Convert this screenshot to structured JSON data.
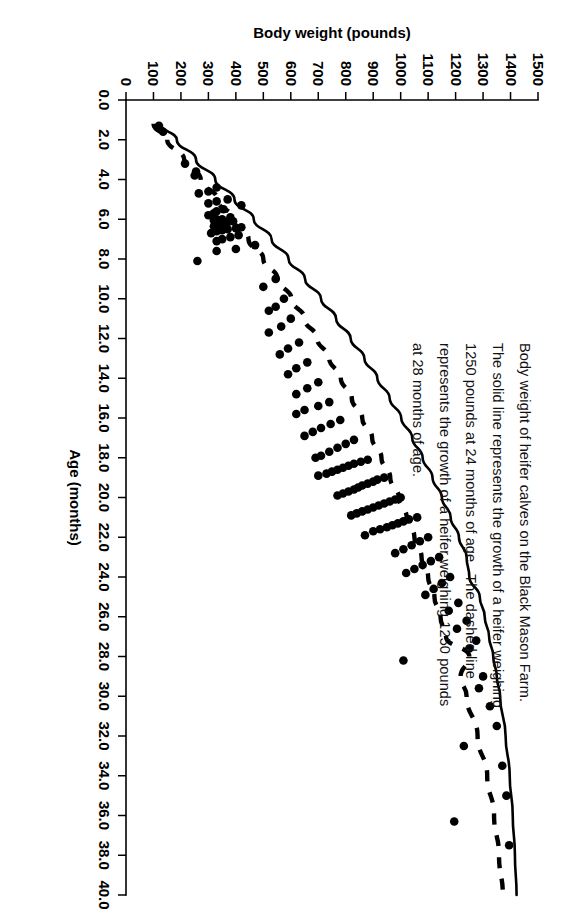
{
  "figure": {
    "caption": "Body weight of heifer calves on the Black Mason Farm.  The solid line represents the growth of a heifer weighing 1250 pounds at 24 months of age.  The dashed line represents the growth of a heifer weighing 1250 pounds at 28 months of age.",
    "ink_color": "#000000",
    "background_color": "#ffffff"
  },
  "chart_data": {
    "type": "scatter",
    "title": "",
    "subtitle": "",
    "xlabel": "Age (months)",
    "ylabel": "Body weight (pounds)",
    "xlim": [
      0,
      40
    ],
    "ylim": [
      0,
      1500
    ],
    "xticks": [
      "0.0",
      "2.0",
      "4.0",
      "6.0",
      "8.0",
      "10.0",
      "12.0",
      "14.0",
      "16.0",
      "18.0",
      "20.0",
      "22.0",
      "24.0",
      "26.0",
      "28.0",
      "30.0",
      "32.0",
      "34.0",
      "36.0",
      "38.0",
      "40.0"
    ],
    "xtick_values": [
      0,
      2,
      4,
      6,
      8,
      10,
      12,
      14,
      16,
      18,
      20,
      22,
      24,
      26,
      28,
      30,
      32,
      34,
      36,
      38,
      40
    ],
    "yticks": [
      "0",
      "100",
      "200",
      "300",
      "400",
      "500",
      "600",
      "700",
      "800",
      "900",
      "1000",
      "1100",
      "1200",
      "1300",
      "1400",
      "1500"
    ],
    "ytick_values": [
      0,
      100,
      200,
      300,
      400,
      500,
      600,
      700,
      800,
      900,
      1000,
      1100,
      1200,
      1300,
      1400,
      1500
    ],
    "grid": false,
    "legend_position": "none",
    "orientation": "rotated-90cw",
    "annotations": [
      "Body weight of heifer calves on the Black Mason Farm.",
      "The solid line represents the growth of a heifer weighing 1250 pounds at 24 months of age.",
      "The dashed line represents the growth of a heifer weighing 1250 pounds at 28 months of age."
    ],
    "series": [
      {
        "name": "Heifer calves (observed body weights)",
        "type": "scatter",
        "marker": "filled-circle",
        "color": "#000000",
        "points": [
          [
            1.3,
            120
          ],
          [
            1.6,
            135
          ],
          [
            3.2,
            215
          ],
          [
            3.6,
            255
          ],
          [
            3.8,
            250
          ],
          [
            4.4,
            330
          ],
          [
            4.6,
            300
          ],
          [
            4.7,
            265
          ],
          [
            5.0,
            370
          ],
          [
            5.1,
            330
          ],
          [
            5.2,
            300
          ],
          [
            5.3,
            420
          ],
          [
            5.5,
            355
          ],
          [
            5.6,
            330
          ],
          [
            5.7,
            320
          ],
          [
            5.8,
            300
          ],
          [
            5.9,
            380
          ],
          [
            6.0,
            350
          ],
          [
            6.0,
            330
          ],
          [
            6.05,
            320
          ],
          [
            6.1,
            390
          ],
          [
            6.15,
            370
          ],
          [
            6.2,
            355
          ],
          [
            6.25,
            340
          ],
          [
            6.3,
            330
          ],
          [
            6.35,
            320
          ],
          [
            6.4,
            420
          ],
          [
            6.45,
            400
          ],
          [
            6.5,
            370
          ],
          [
            6.55,
            350
          ],
          [
            6.6,
            330
          ],
          [
            6.7,
            310
          ],
          [
            6.8,
            410
          ],
          [
            6.9,
            380
          ],
          [
            7.0,
            350
          ],
          [
            7.1,
            330
          ],
          [
            7.3,
            470
          ],
          [
            7.5,
            400
          ],
          [
            7.6,
            330
          ],
          [
            8.1,
            260
          ],
          [
            9.0,
            545
          ],
          [
            9.4,
            500
          ],
          [
            10.0,
            575
          ],
          [
            10.4,
            545
          ],
          [
            10.6,
            520
          ],
          [
            11.0,
            600
          ],
          [
            11.4,
            565
          ],
          [
            11.7,
            520
          ],
          [
            12.2,
            630
          ],
          [
            12.5,
            590
          ],
          [
            12.8,
            560
          ],
          [
            13.2,
            660
          ],
          [
            13.5,
            620
          ],
          [
            13.8,
            590
          ],
          [
            14.2,
            700
          ],
          [
            14.5,
            660
          ],
          [
            14.8,
            620
          ],
          [
            15.2,
            740
          ],
          [
            15.4,
            700
          ],
          [
            15.6,
            650
          ],
          [
            15.8,
            620
          ],
          [
            16.1,
            780
          ],
          [
            16.3,
            745
          ],
          [
            16.5,
            710
          ],
          [
            16.7,
            680
          ],
          [
            16.9,
            650
          ],
          [
            17.1,
            830
          ],
          [
            17.3,
            800
          ],
          [
            17.5,
            770
          ],
          [
            17.7,
            740
          ],
          [
            17.9,
            710
          ],
          [
            18.0,
            690
          ],
          [
            18.1,
            880
          ],
          [
            18.2,
            855
          ],
          [
            18.3,
            830
          ],
          [
            18.4,
            810
          ],
          [
            18.5,
            790
          ],
          [
            18.6,
            770
          ],
          [
            18.7,
            750
          ],
          [
            18.8,
            730
          ],
          [
            18.9,
            700
          ],
          [
            19.0,
            940
          ],
          [
            19.1,
            915
          ],
          [
            19.2,
            900
          ],
          [
            19.3,
            880
          ],
          [
            19.4,
            860
          ],
          [
            19.5,
            845
          ],
          [
            19.6,
            830
          ],
          [
            19.7,
            810
          ],
          [
            19.8,
            790
          ],
          [
            19.9,
            770
          ],
          [
            20.0,
            1000
          ],
          [
            20.1,
            980
          ],
          [
            20.2,
            960
          ],
          [
            20.3,
            940
          ],
          [
            20.4,
            920
          ],
          [
            20.5,
            900
          ],
          [
            20.6,
            880
          ],
          [
            20.7,
            860
          ],
          [
            20.8,
            840
          ],
          [
            20.9,
            820
          ],
          [
            21.0,
            1060
          ],
          [
            21.1,
            1030
          ],
          [
            21.2,
            1010
          ],
          [
            21.3,
            990
          ],
          [
            21.4,
            970
          ],
          [
            21.5,
            950
          ],
          [
            21.6,
            925
          ],
          [
            21.7,
            900
          ],
          [
            21.9,
            870
          ],
          [
            22.0,
            1100
          ],
          [
            22.2,
            1070
          ],
          [
            22.4,
            1040
          ],
          [
            22.6,
            1010
          ],
          [
            22.8,
            980
          ],
          [
            23.0,
            1140
          ],
          [
            23.2,
            1110
          ],
          [
            23.4,
            1080
          ],
          [
            23.6,
            1050
          ],
          [
            23.8,
            1020
          ],
          [
            24.0,
            1180
          ],
          [
            24.3,
            1150
          ],
          [
            24.6,
            1120
          ],
          [
            24.9,
            1090
          ],
          [
            25.3,
            1210
          ],
          [
            25.7,
            1175
          ],
          [
            26.2,
            1240
          ],
          [
            26.6,
            1205
          ],
          [
            27.2,
            1275
          ],
          [
            27.6,
            1250
          ],
          [
            28.2,
            1010
          ],
          [
            29.0,
            1300
          ],
          [
            29.6,
            1285
          ],
          [
            30.5,
            1325
          ],
          [
            31.5,
            1350
          ],
          [
            32.5,
            1230
          ],
          [
            33.5,
            1370
          ],
          [
            35.0,
            1385
          ],
          [
            36.3,
            1195
          ],
          [
            37.5,
            1395
          ]
        ]
      },
      {
        "name": "Solid line — heifer weighing 1250 pounds at 24 months of age",
        "type": "line",
        "style": "solid",
        "color": "#000000",
        "points": [
          [
            1.2,
            125
          ],
          [
            2.0,
            185
          ],
          [
            3.0,
            255
          ],
          [
            4.0,
            325
          ],
          [
            5.0,
            395
          ],
          [
            6.0,
            465
          ],
          [
            7.0,
            530
          ],
          [
            8.0,
            592
          ],
          [
            9.0,
            652
          ],
          [
            10.0,
            710
          ],
          [
            11.0,
            765
          ],
          [
            12.0,
            818
          ],
          [
            13.0,
            868
          ],
          [
            14.0,
            915
          ],
          [
            15.0,
            960
          ],
          [
            16.0,
            1002
          ],
          [
            17.0,
            1042
          ],
          [
            18.0,
            1080
          ],
          [
            19.0,
            1116
          ],
          [
            20.0,
            1150
          ],
          [
            21.0,
            1182
          ],
          [
            22.0,
            1212
          ],
          [
            23.0,
            1240
          ],
          [
            24.0,
            1250
          ],
          [
            25.0,
            1288
          ],
          [
            26.0,
            1306
          ],
          [
            27.0,
            1322
          ],
          [
            28.0,
            1337
          ],
          [
            29.0,
            1350
          ],
          [
            30.0,
            1362
          ],
          [
            32.0,
            1382
          ],
          [
            34.0,
            1397
          ],
          [
            36.0,
            1408
          ],
          [
            38.0,
            1416
          ],
          [
            40.0,
            1422
          ]
        ]
      },
      {
        "name": "Dashed line — heifer weighing 1250 pounds at 28 months of age",
        "type": "line",
        "style": "dashed",
        "color": "#000000",
        "points": [
          [
            1.2,
            100
          ],
          [
            2.0,
            150
          ],
          [
            3.0,
            212
          ],
          [
            4.0,
            272
          ],
          [
            5.0,
            332
          ],
          [
            6.0,
            390
          ],
          [
            7.0,
            446
          ],
          [
            8.0,
            500
          ],
          [
            9.0,
            552
          ],
          [
            10.0,
            602
          ],
          [
            11.0,
            650
          ],
          [
            12.0,
            696
          ],
          [
            13.0,
            740
          ],
          [
            14.0,
            782
          ],
          [
            15.0,
            822
          ],
          [
            16.0,
            860
          ],
          [
            17.0,
            896
          ],
          [
            18.0,
            930
          ],
          [
            19.0,
            962
          ],
          [
            20.0,
            993
          ],
          [
            21.0,
            1022
          ],
          [
            22.0,
            1050
          ],
          [
            23.0,
            1076
          ],
          [
            24.0,
            1100
          ],
          [
            25.0,
            1123
          ],
          [
            26.0,
            1145
          ],
          [
            27.0,
            1165
          ],
          [
            28.0,
            1250
          ],
          [
            29.0,
            1218
          ],
          [
            30.0,
            1240
          ],
          [
            32.0,
            1280
          ],
          [
            34.0,
            1315
          ],
          [
            36.0,
            1340
          ],
          [
            38.0,
            1358
          ],
          [
            40.0,
            1372
          ]
        ]
      }
    ]
  }
}
